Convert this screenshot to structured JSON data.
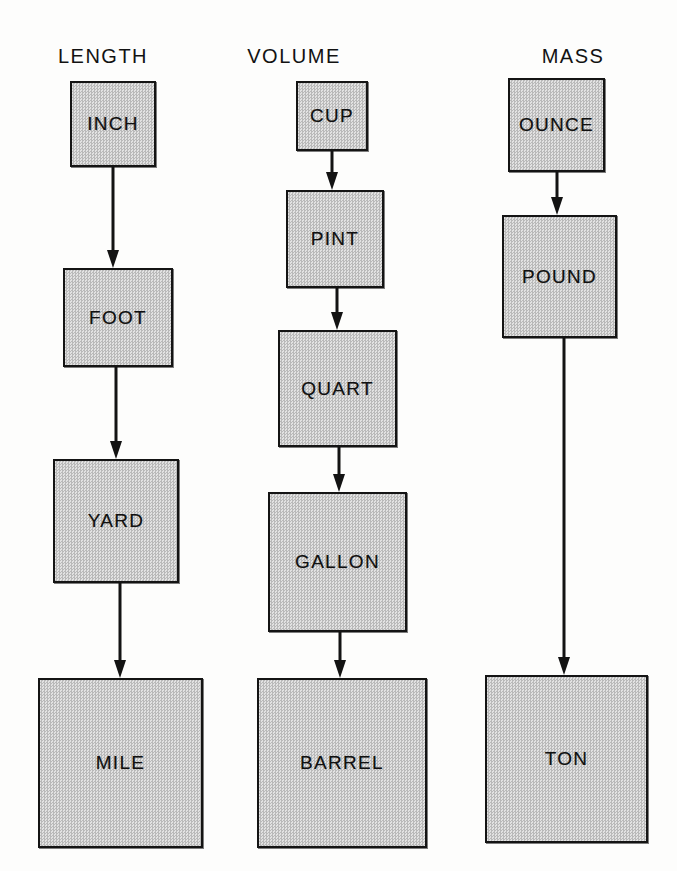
{
  "diagram": {
    "background_color": "#fdfdfc",
    "box_fill_color": "#cfcfcf",
    "box_border_color": "#141414",
    "arrow_color": "#131313",
    "columns": [
      {
        "id": "length",
        "header": "LENGTH",
        "header_x": 103,
        "header_y": 45,
        "boxes": [
          {
            "label": "INCH",
            "x": 70,
            "y": 81,
            "w": 86,
            "h": 86
          },
          {
            "label": "FOOT",
            "x": 63,
            "y": 268,
            "w": 110,
            "h": 99
          },
          {
            "label": "YARD",
            "x": 53,
            "y": 459,
            "w": 126,
            "h": 124
          },
          {
            "label": "MILE",
            "x": 38,
            "y": 678,
            "w": 165,
            "h": 170
          }
        ],
        "arrows": [
          {
            "from": "INCH",
            "to": "FOOT",
            "x": 113,
            "y1": 167,
            "y2": 268
          },
          {
            "from": "FOOT",
            "to": "YARD",
            "x": 116,
            "y1": 367,
            "y2": 459
          },
          {
            "from": "YARD",
            "to": "MILE",
            "x": 120,
            "y1": 583,
            "y2": 678
          }
        ]
      },
      {
        "id": "volume",
        "header": "VOLUME",
        "header_x": 294,
        "header_y": 45,
        "boxes": [
          {
            "label": "CUP",
            "x": 296,
            "y": 81,
            "w": 72,
            "h": 70
          },
          {
            "label": "PINT",
            "x": 286,
            "y": 190,
            "w": 98,
            "h": 98
          },
          {
            "label": "QUART",
            "x": 278,
            "y": 330,
            "w": 119,
            "h": 117
          },
          {
            "label": "GALLON",
            "x": 268,
            "y": 492,
            "w": 139,
            "h": 140
          },
          {
            "label": "BARREL",
            "x": 257,
            "y": 678,
            "w": 170,
            "h": 170
          }
        ],
        "arrows": [
          {
            "from": "CUP",
            "to": "PINT",
            "x": 332,
            "y1": 151,
            "y2": 190
          },
          {
            "from": "PINT",
            "to": "QUART",
            "x": 337,
            "y1": 288,
            "y2": 330
          },
          {
            "from": "QUART",
            "to": "GALLON",
            "x": 339,
            "y1": 447,
            "y2": 492
          },
          {
            "from": "GALLON",
            "to": "BARREL",
            "x": 340,
            "y1": 632,
            "y2": 678
          }
        ]
      },
      {
        "id": "mass",
        "header": "MASS",
        "header_x": 573,
        "header_y": 45,
        "boxes": [
          {
            "label": "OUNCE",
            "x": 508,
            "y": 78,
            "w": 97,
            "h": 94
          },
          {
            "label": "POUND",
            "x": 502,
            "y": 215,
            "w": 115,
            "h": 123
          },
          {
            "label": "TON",
            "x": 485,
            "y": 675,
            "w": 163,
            "h": 168
          }
        ],
        "arrows": [
          {
            "from": "OUNCE",
            "to": "POUND",
            "x": 557,
            "y1": 172,
            "y2": 215
          },
          {
            "from": "POUND",
            "to": "TON",
            "x": 564,
            "y1": 338,
            "y2": 675
          }
        ]
      }
    ]
  }
}
